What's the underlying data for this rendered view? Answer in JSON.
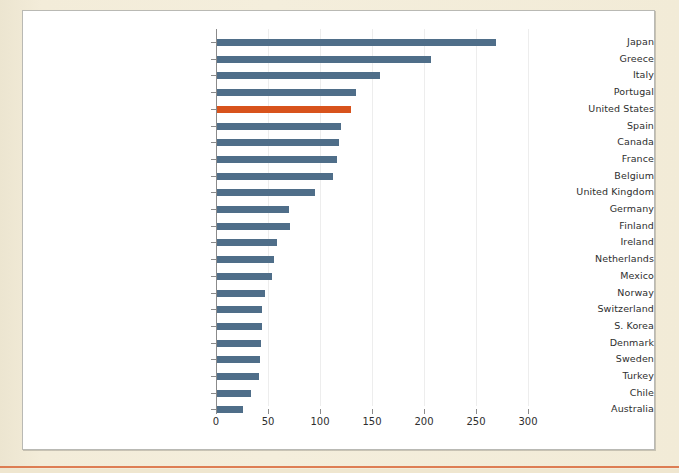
{
  "page": {
    "background_color": "#f3ecd9",
    "panel_background": "#ffffff",
    "panel_border_color": "#b9b9b4",
    "bottom_rule_color": "#d96a3c"
  },
  "chart_data": {
    "type": "bar",
    "orientation": "horizontal",
    "title": "",
    "subtitle": "",
    "xlabel": "",
    "ylabel": "",
    "xlim": [
      0,
      300
    ],
    "xticks": [
      0,
      50,
      100,
      150,
      200,
      250,
      300
    ],
    "grid": "vertical",
    "legend": "none",
    "bar_color": "#4f6e89",
    "highlight_color": "#d8531c",
    "highlight_category": "United States",
    "categories": [
      "Japan",
      "Greece",
      "Italy",
      "Portugal",
      "United States",
      "Spain",
      "Canada",
      "France",
      "Belgium",
      "United Kingdom",
      "Germany",
      "Finland",
      "Ireland",
      "Netherlands",
      "Mexico",
      "Norway",
      "Switzerland",
      "S. Korea",
      "Denmark",
      "Sweden",
      "Turkey",
      "Chile",
      "Australia"
    ],
    "values": [
      268,
      206,
      157,
      134,
      129,
      119,
      117,
      115,
      112,
      94,
      69,
      70,
      58,
      55,
      53,
      46,
      43,
      43,
      42,
      41,
      40,
      33,
      25
    ]
  }
}
